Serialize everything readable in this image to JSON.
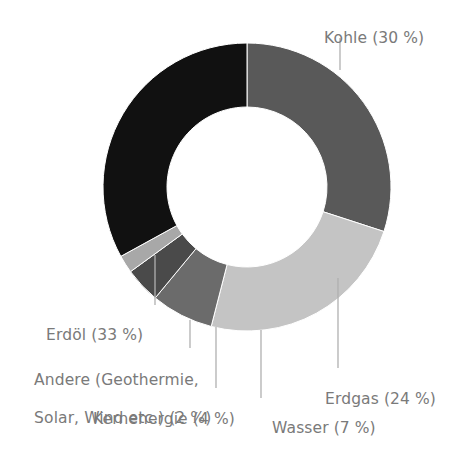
{
  "chart_data": {
    "type": "pie",
    "variant": "donut",
    "title": "",
    "subtitle": "",
    "xlabel": "",
    "ylabel": "",
    "units": "%",
    "total": 100,
    "legend_position": "none",
    "labels_position": "outside-with-leader-lines",
    "grid": false,
    "categories": [
      "Kohle",
      "Erdgas",
      "Wasser",
      "Kernenergie",
      "Andere (Geothermie, Solar, Wind etc.)",
      "Erdöl"
    ],
    "values": [
      30,
      24,
      7,
      4,
      2,
      33
    ],
    "colors": [
      "#595959",
      "#c4c4c4",
      "#6b6b6b",
      "#4a4a4a",
      "#a8a8a8",
      "#111111"
    ],
    "slices": [
      {
        "name": "Kohle",
        "value": 30,
        "color": "#595959",
        "label": "Kohle (30 %)",
        "label_lines": [
          "Kohle (30 %)"
        ],
        "start_angle_deg": 0,
        "end_angle_deg": 108
      },
      {
        "name": "Erdgas",
        "value": 24,
        "color": "#c4c4c4",
        "label": "Erdgas (24 %)",
        "label_lines": [
          "Erdgas (24 %)"
        ],
        "start_angle_deg": 108,
        "end_angle_deg": 194.4
      },
      {
        "name": "Wasser",
        "value": 7,
        "color": "#6b6b6b",
        "label": "Wasser (7 %)",
        "label_lines": [
          "Wasser (7 %)"
        ],
        "start_angle_deg": 194.4,
        "end_angle_deg": 219.6
      },
      {
        "name": "Kernenergie",
        "value": 4,
        "color": "#4a4a4a",
        "label": "Kernenergie (4 %)",
        "label_lines": [
          "Kernenergie (4 %)"
        ],
        "start_angle_deg": 219.6,
        "end_angle_deg": 234
      },
      {
        "name": "Andere (Geothermie, Solar, Wind etc.)",
        "value": 2,
        "color": "#a8a8a8",
        "label": "Andere (Geothermie, Solar, Wind etc.) (2 %)",
        "label_lines": [
          "Andere (Geothermie,",
          "Solar, Wind etc.) (2 %)"
        ],
        "start_angle_deg": 234,
        "end_angle_deg": 241.2
      },
      {
        "name": "Erdöl",
        "value": 33,
        "color": "#111111",
        "label": "Erdöl (33 %)",
        "label_lines": [
          "Erdöl (33 %)"
        ],
        "start_angle_deg": 241.2,
        "end_angle_deg": 360
      }
    ]
  },
  "labels": {
    "kohle": "Kohle (30 %)",
    "erdgas": "Erdgas (24 %)",
    "wasser": "Wasser (7 %)",
    "kernenergie": "Kernenergie (4 %)",
    "andere_line1": "Andere (Geothermie,",
    "andere_line2": "Solar, Wind etc.) (2 %)",
    "erdoel": "Erdöl (33 %)"
  },
  "style": {
    "background": "#ffffff",
    "label_color": "#7a7a7a",
    "leader_line_color": "#b0b0b0"
  },
  "geometry": {
    "center_x": 247,
    "center_y": 187,
    "outer_radius": 144,
    "inner_radius": 80
  }
}
